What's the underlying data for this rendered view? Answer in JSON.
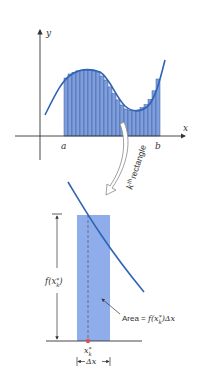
{
  "top_graph": {
    "y_axis_label": "y",
    "x_axis_label": "x",
    "a_label": "a",
    "b_label": "b",
    "rect_count": 24,
    "annotation_sup": "th",
    "annotation_k": "k",
    "annotation_text": "rectangle"
  },
  "detail": {
    "height_label_f": "f(x",
    "height_label_sub": "k",
    "height_label_sup": "*",
    "height_label_close": ")",
    "area_prefix": "Area = ",
    "area_formula": "f(x",
    "area_sub": "k",
    "area_sup": "*",
    "area_close": ")Δx",
    "point_label": "x",
    "point_sub": "k",
    "point_sup": "*",
    "width_label": "Δx"
  },
  "colors": {
    "curve": "#2f63b5",
    "rect_fill": "#7f9fdc",
    "rect_stripe": "#3a5aa0",
    "detail_fill": "#8fadea",
    "axis": "#333333",
    "point": "#e05050"
  }
}
